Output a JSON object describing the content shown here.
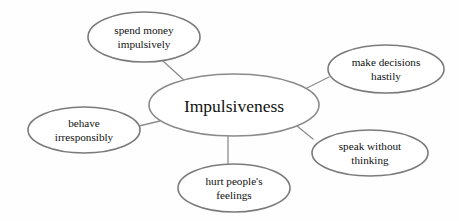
{
  "diagram": {
    "type": "mind-map",
    "title": "Impulsiveness",
    "background_color": "#fefefe",
    "outline_color": "#7b7b7b",
    "connector_color": "#8d8d8d",
    "text_color": "#111111",
    "center": {
      "label": "Impulsiveness",
      "cx": 234,
      "cy": 105,
      "rx": 85,
      "ry": 31,
      "fill_light": "#fdfdfd",
      "fill_dark": "#e3e3e3"
    },
    "branches": [
      {
        "id": "spend-money-impulsively",
        "line1": "spend money",
        "line2": "impulsively",
        "cx": 144,
        "cy": 37,
        "rx": 56,
        "ry": 25,
        "connector": {
          "x1": 163,
          "y1": 61,
          "x2": 186,
          "y2": 82
        }
      },
      {
        "id": "make-decisions-hastily",
        "line1": "make decisions",
        "line2": "hastily",
        "cx": 386,
        "cy": 69,
        "rx": 58,
        "ry": 24,
        "connector": {
          "x1": 329,
          "y1": 77,
          "x2": 307,
          "y2": 88
        }
      },
      {
        "id": "behave-irresponsibly",
        "line1": "behave",
        "line2": "irresponsibly",
        "cx": 84,
        "cy": 130,
        "rx": 56,
        "ry": 23,
        "connector": {
          "x1": 139,
          "y1": 126,
          "x2": 160,
          "y2": 121
        }
      },
      {
        "id": "speak-without-thinking",
        "line1": "speak without",
        "line2": "thinking",
        "cx": 370,
        "cy": 153,
        "rx": 58,
        "ry": 23,
        "connector": {
          "x1": 313,
          "y1": 139,
          "x2": 297,
          "y2": 126
        }
      },
      {
        "id": "hurt-peoples-feelings",
        "line1": "hurt people's",
        "line2": "feelings",
        "cx": 234,
        "cy": 188,
        "rx": 56,
        "ry": 24,
        "connector": {
          "x1": 228,
          "y1": 136,
          "x2": 228,
          "y2": 164
        }
      }
    ]
  }
}
